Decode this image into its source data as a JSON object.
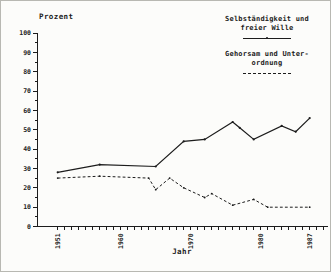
{
  "window": {
    "background": "#fcfcfa"
  },
  "axes": {
    "ylabel": "Prozent",
    "xlabel": "Jahr"
  },
  "legend": {
    "entries": [
      {
        "label": "Selbständigkeit und\nfreier Wille",
        "line_style": "solid"
      },
      {
        "label": "Gehorsam und Unter-\nordnung",
        "line_style": "dashed"
      }
    ]
  },
  "chart_data": {
    "type": "line",
    "title": "",
    "ylabel": "Prozent",
    "xlabel": "Jahr",
    "ylim": [
      0,
      100
    ],
    "ytick_label_step": 10,
    "ytick_minor_step": 5,
    "xlim": [
      1951,
      1989
    ],
    "xtick_minor_step_years": 1,
    "xtick_labels": [
      "1951",
      "1960",
      "1970",
      "1980",
      "1987"
    ],
    "grid": false,
    "legend_position": "top-right",
    "line_color": "#1c1c1c",
    "series": [
      {
        "name": "Selbständigkeit und freier Wille",
        "style": "solid",
        "points": [
          [
            1951,
            28
          ],
          [
            1957,
            32
          ],
          [
            1965,
            31
          ],
          [
            1969,
            44
          ],
          [
            1972,
            45
          ],
          [
            1976,
            54
          ],
          [
            1977,
            51
          ],
          [
            1979,
            45
          ],
          [
            1983,
            52
          ],
          [
            1985,
            49
          ],
          [
            1987,
            56
          ]
        ]
      },
      {
        "name": "Gehorsam und Unterordnung",
        "style": "dashed",
        "points": [
          [
            1951,
            25
          ],
          [
            1957,
            26
          ],
          [
            1964,
            25
          ],
          [
            1965,
            19
          ],
          [
            1967,
            25
          ],
          [
            1969,
            20
          ],
          [
            1972,
            15
          ],
          [
            1973,
            17
          ],
          [
            1976,
            11
          ],
          [
            1979,
            14
          ],
          [
            1981,
            10
          ],
          [
            1987,
            10
          ]
        ]
      }
    ]
  }
}
